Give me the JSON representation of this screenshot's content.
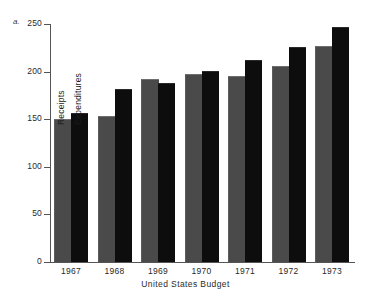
{
  "figure": {
    "letter": "a."
  },
  "chart_data": {
    "type": "bar",
    "title": "",
    "xlabel": "United States Budget",
    "ylabel": "",
    "categories": [
      "1967",
      "1968",
      "1969",
      "1970",
      "1971",
      "1972",
      "1973"
    ],
    "series": [
      {
        "name": "Receipts",
        "color": "#4a4a4a",
        "values": [
          149,
          152,
          191,
          196,
          194,
          205,
          226
        ]
      },
      {
        "name": "Expenditures",
        "color": "#0d0d0d",
        "values": [
          155,
          181,
          187,
          200,
          211,
          225,
          246
        ]
      }
    ],
    "ylim": [
      0,
      250
    ],
    "yticks": [
      0,
      50,
      100,
      150,
      200,
      250
    ],
    "ytick_labels": [
      "0",
      "50",
      "100",
      "150",
      "200",
      "250"
    ],
    "grid": false,
    "legend": "in-plot-rotated-labels"
  }
}
